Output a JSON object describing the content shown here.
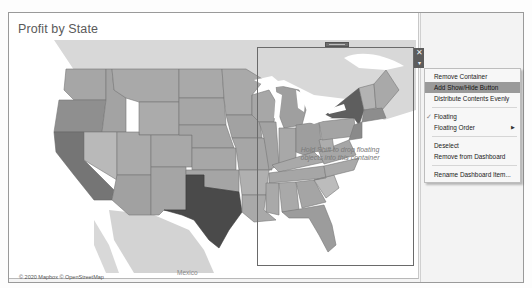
{
  "dashboard": {
    "sheet_title": "Profit by State",
    "attribution": "© 2020 Mapbox © OpenStreetMap",
    "map_label_mexico": "Mexico"
  },
  "floating_container": {
    "drop_hint_line1": "Hold Shift to drop floating",
    "drop_hint_line2": "objects into this container",
    "close_icon_glyph": "✕",
    "more_options_glyph": "▾"
  },
  "context_menu": {
    "items": [
      {
        "label": "Remove Container",
        "highlighted": false
      },
      {
        "label": "Add Show/Hide Button",
        "highlighted": true
      },
      {
        "label": "Distribute Contents Evenly",
        "highlighted": false
      },
      {
        "label": "Floating",
        "checked": true
      },
      {
        "label": "Floating Order",
        "submenu": true
      },
      {
        "label": "Deselect"
      },
      {
        "label": "Remove from Dashboard"
      },
      {
        "label": "Rename Dashboard Item..."
      }
    ],
    "check_glyph": "✓",
    "submenu_glyph": "▶"
  },
  "colors": {
    "state_fill": "#a9a9a9",
    "state_fill_light": "#bdbdbd",
    "state_fill_mid": "#9d9d9d",
    "state_fill_dark": "#4a4a4a",
    "state_fill_darker": "#6e6e6e",
    "land_outside": "#d6d6d6",
    "water": "#ffffff",
    "menu_highlight": "#9a9a9a"
  }
}
